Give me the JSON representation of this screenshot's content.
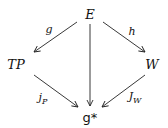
{
  "diagram": {
    "type": "commutative-diagram",
    "nodes": {
      "E": "E",
      "TP": "TP",
      "W": "W",
      "gstar": "g*"
    },
    "arrows": [
      {
        "from": "E",
        "to": "TP",
        "label": "g"
      },
      {
        "from": "E",
        "to": "W",
        "label": "h"
      },
      {
        "from": "E",
        "to": "g*",
        "label": ""
      },
      {
        "from": "TP",
        "to": "g*",
        "label": "j_P"
      },
      {
        "from": "W",
        "to": "g*",
        "label": "J_W"
      }
    ],
    "labels": {
      "g": "g",
      "h": "h",
      "jP_base": "j",
      "jP_sub": "P",
      "JW_base": "J",
      "JW_sub": "W"
    }
  }
}
